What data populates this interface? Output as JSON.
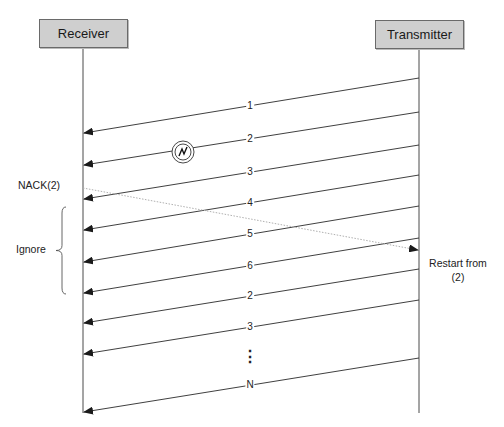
{
  "diagram": {
    "type": "sequence",
    "title": "",
    "participants": [
      {
        "name": "Receiver",
        "x": 83,
        "box": {
          "left": 39,
          "top": 19,
          "width": 89,
          "height": 29
        }
      },
      {
        "name": "Transmitter",
        "x": 419,
        "box": {
          "left": 375,
          "top": 20,
          "width": 89,
          "height": 29
        }
      }
    ],
    "lifeline_end_y": 413,
    "messages": [
      {
        "label": "1",
        "from": "Transmitter",
        "to": "Receiver",
        "y_from": 78,
        "y_to": 133,
        "label_y": 105
      },
      {
        "label": "2",
        "from": "Transmitter",
        "to": "Receiver",
        "y_from": 112,
        "y_to": 165,
        "label_y": 139,
        "error": true
      },
      {
        "label": "3",
        "from": "Transmitter",
        "to": "Receiver",
        "y_from": 145,
        "y_to": 199,
        "label_y": 172
      },
      {
        "label": "4",
        "from": "Transmitter",
        "to": "Receiver",
        "y_from": 175,
        "y_to": 230,
        "label_y": 203
      },
      {
        "label": "5",
        "from": "Transmitter",
        "to": "Receiver",
        "y_from": 206,
        "y_to": 262,
        "label_y": 234
      },
      {
        "label": "6",
        "from": "Transmitter",
        "to": "Receiver",
        "y_from": 238,
        "y_to": 293,
        "label_y": 265
      },
      {
        "label": "2",
        "from": "Transmitter",
        "to": "Receiver",
        "y_from": 269,
        "y_to": 323,
        "label_y": 296
      },
      {
        "label": "3",
        "from": "Transmitter",
        "to": "Receiver",
        "y_from": 300,
        "y_to": 354,
        "label_y": 327
      },
      {
        "label": "N",
        "from": "Transmitter",
        "to": "Receiver",
        "y_from": 358,
        "y_to": 412,
        "label_y": 385
      }
    ],
    "ellipsis": {
      "label": "⋮",
      "x": 250,
      "y": 357
    },
    "nack": {
      "label": "NACK(2)",
      "from": "Receiver",
      "to": "Transmitter",
      "y_from": 188,
      "y_to": 250,
      "style": "dotted",
      "color": "#b0b0b0"
    },
    "error_icon": {
      "name": "transmission-error-icon",
      "cx": 183,
      "cy": 152,
      "r": 11
    },
    "annotations": {
      "ignore": {
        "label": "Ignore",
        "brace_top": 207,
        "brace_bottom": 294
      },
      "restart": {
        "line1": "Restart from",
        "line2": "(2)"
      }
    },
    "colors": {
      "line": "#2a2a2a",
      "box_fill": "#cfcfcf",
      "box_border": "#6a6a6a",
      "nack": "#b0b0b0"
    }
  }
}
